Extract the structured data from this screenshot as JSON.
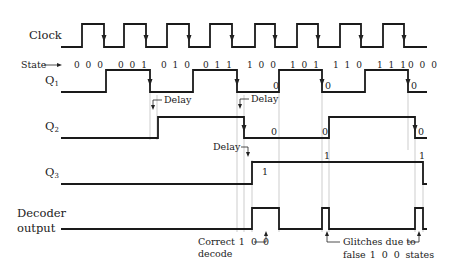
{
  "signals": {
    "clock": {
      "label": "Clock"
    },
    "state": {
      "label": "State"
    },
    "q1": {
      "label": "Q",
      "sub": "1"
    },
    "q2": {
      "label": "Q",
      "sub": "2"
    },
    "q3": {
      "label": "Q",
      "sub": "3"
    },
    "decoder": {
      "label_line1": "Decoder",
      "label_line2": "output"
    }
  },
  "states": [
    "0 0 0",
    "0 0 1",
    "0 1 0",
    "0 1 1",
    "1 0 0",
    "1 0 1",
    "1 1 0",
    "1 1 1",
    "0 0 0"
  ],
  "annotations": {
    "delay": "Delay",
    "zero": "0",
    "one": "1",
    "correct_line1": "Correct",
    "correct_state": "1 0 0",
    "correct_line2": "decode",
    "glitch_line1": "Glitches due to",
    "glitch_line2": "false",
    "glitch_state": "1 0 0",
    "glitch_line3": "states"
  },
  "waveforms": {
    "clock": "M61,47 H82 V24 H104 V47 H124 V24 H146 V47 H167 V24 H189 V47 H210 V24 H232 V47 H255 V24 H275 V47 H297 V24 H318 V47 H340 V24 H361 V47 H383 V24 H404 V47 H427",
    "q1": "M61,92 H106 V70 H150 V92 H193 V70 H237 V92 H279 V70 H322 V92 H365 V70 H408 V92 H427",
    "q2": "M61,138 H158 V117 H244 V138 H329 V117 H415 V138 H427",
    "q3": "M61,184 H252 V162 H423 V184 H427",
    "decoder": "M61,229 H252 V208 H279 V229 H322 V208 H329 V229 H415 V208 H423 V229 H427"
  },
  "colors": {
    "line": "#1a1a1a",
    "guide": "#b8b8b8",
    "background": "#ffffff"
  }
}
